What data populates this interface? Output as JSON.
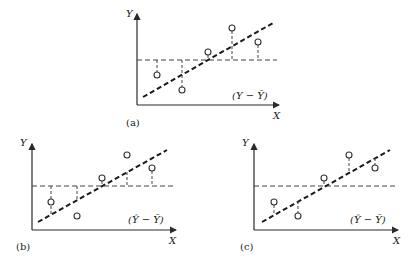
{
  "figure": {
    "panels": [
      {
        "id": "a",
        "caption": "(a)",
        "y_label": "Y",
        "x_label": "X",
        "deviation_label": "(Y − Ȳ)",
        "stem_mode": "point-to-mean"
      },
      {
        "id": "b",
        "caption": "(b)",
        "y_label": "Y",
        "x_label": "X",
        "deviation_label": "(Ŷ − Ȳ)",
        "stem_mode": "regression-to-mean"
      },
      {
        "id": "c",
        "caption": "(c)",
        "y_label": "Y",
        "x_label": "X",
        "deviation_label": "(Ŷ − Ȳ)",
        "stem_mode": "point-to-regression"
      }
    ],
    "legend": {
      "dashed_horizontal": "mean line Ȳ",
      "bold_dashed_diagonal": "fitted regression line Ŷ",
      "open_circles": "observations"
    }
  }
}
